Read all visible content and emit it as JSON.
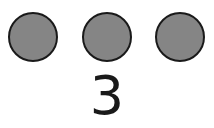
{
  "counting_card": {
    "dots": [
      {
        "shape": "circle",
        "fill": "#858585"
      },
      {
        "shape": "circle",
        "fill": "#858585"
      },
      {
        "shape": "circle",
        "fill": "#858585"
      }
    ],
    "count_label": "3",
    "colors": {
      "dot_fill": "#858585",
      "outline": "#1a1a1a",
      "background": "#ffffff"
    }
  }
}
